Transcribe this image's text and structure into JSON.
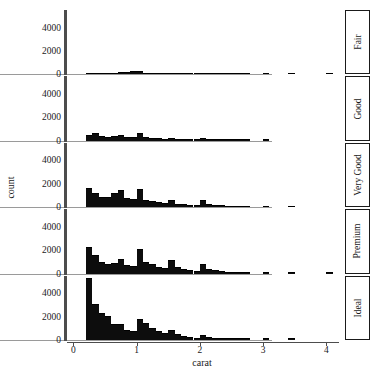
{
  "chart_data": {
    "type": "bar",
    "title": "",
    "subtitle": "",
    "xlabel": "carat",
    "ylabel": "count",
    "xlim": [
      -0.1,
      4.2
    ],
    "ylim": [
      0,
      5500
    ],
    "xticks": [
      0,
      1,
      2,
      3,
      4
    ],
    "xtick_labels": [
      "0",
      "1",
      "2",
      "3",
      "4"
    ],
    "yticks": [
      0,
      2000,
      4000
    ],
    "ytick_labels": [
      "0",
      "2000",
      "4000"
    ],
    "grid": false,
    "legend": "none",
    "facet_variable": "cut",
    "facet_position": "right-strip",
    "bin_width": 0.1,
    "bar_color": "#0d0d0d",
    "panel_background": "#ffffff",
    "facets": [
      {
        "label": "Fair",
        "bin_centers": [
          0.25,
          0.35,
          0.45,
          0.55,
          0.65,
          0.75,
          0.85,
          0.95,
          1.05,
          1.15,
          1.25,
          1.35,
          1.45,
          1.55,
          1.65,
          1.75,
          1.85,
          1.95,
          2.05,
          2.15,
          2.25,
          2.35,
          2.45,
          2.55,
          2.65,
          2.75,
          3.05,
          3.45,
          4.05,
          4.55,
          5.05
        ],
        "values": [
          40,
          60,
          35,
          35,
          60,
          90,
          140,
          180,
          230,
          60,
          50,
          35,
          40,
          30,
          40,
          30,
          20,
          15,
          40,
          30,
          20,
          15,
          10,
          8,
          6,
          5,
          4,
          3,
          2,
          2,
          1
        ]
      },
      {
        "label": "Good",
        "bin_centers": [
          0.25,
          0.35,
          0.45,
          0.55,
          0.65,
          0.75,
          0.85,
          0.95,
          1.05,
          1.15,
          1.25,
          1.35,
          1.45,
          1.55,
          1.65,
          1.75,
          1.85,
          1.95,
          2.05,
          2.15,
          2.25,
          2.35,
          2.45,
          2.55,
          2.65,
          2.75,
          3.05
        ],
        "values": [
          430,
          560,
          300,
          230,
          290,
          420,
          250,
          200,
          600,
          200,
          170,
          120,
          110,
          160,
          80,
          60,
          45,
          35,
          190,
          80,
          50,
          30,
          20,
          15,
          10,
          8,
          5
        ]
      },
      {
        "label": "Very Good",
        "bin_centers": [
          0.25,
          0.35,
          0.45,
          0.55,
          0.65,
          0.75,
          0.85,
          0.95,
          1.05,
          1.15,
          1.25,
          1.35,
          1.45,
          1.55,
          1.65,
          1.75,
          1.85,
          1.95,
          2.05,
          2.15,
          2.25,
          2.35,
          2.45,
          2.55,
          2.65,
          2.75,
          3.05,
          3.45
        ],
        "values": [
          1550,
          1150,
          800,
          750,
          1100,
          1400,
          700,
          600,
          1500,
          560,
          450,
          330,
          300,
          560,
          220,
          150,
          110,
          80,
          520,
          200,
          120,
          70,
          45,
          30,
          20,
          14,
          8,
          4
        ]
      },
      {
        "label": "Premium",
        "bin_centers": [
          0.25,
          0.35,
          0.45,
          0.55,
          0.65,
          0.75,
          0.85,
          0.95,
          1.05,
          1.15,
          1.25,
          1.35,
          1.45,
          1.55,
          1.65,
          1.75,
          1.85,
          1.95,
          2.05,
          2.15,
          2.25,
          2.35,
          2.45,
          2.55,
          2.65,
          2.75,
          3.05,
          3.45,
          4.05
        ],
        "values": [
          2150,
          1500,
          900,
          700,
          780,
          1150,
          620,
          560,
          2000,
          900,
          700,
          480,
          420,
          1100,
          450,
          300,
          200,
          150,
          760,
          330,
          200,
          120,
          80,
          50,
          35,
          22,
          12,
          6,
          3
        ]
      },
      {
        "label": "Ideal",
        "bin_centers": [
          0.25,
          0.35,
          0.45,
          0.55,
          0.65,
          0.75,
          0.85,
          0.95,
          1.05,
          1.15,
          1.25,
          1.35,
          1.45,
          1.55,
          1.65,
          1.75,
          1.85,
          1.95,
          2.05,
          2.15,
          2.25,
          2.35,
          2.45,
          2.55,
          2.65,
          2.75,
          3.05,
          3.45
        ],
        "values": [
          5200,
          3000,
          2200,
          2000,
          1300,
          1250,
          800,
          700,
          1700,
          1350,
          950,
          650,
          480,
          800,
          400,
          230,
          150,
          100,
          330,
          140,
          80,
          45,
          28,
          18,
          12,
          8,
          5,
          2
        ]
      }
    ]
  },
  "axes": {
    "y_title": "count",
    "x_title": "carat"
  }
}
